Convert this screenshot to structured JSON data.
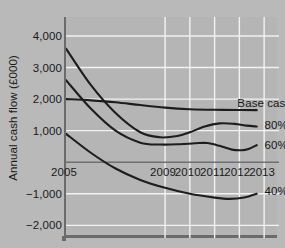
{
  "chart_data": {
    "type": "line",
    "title": "",
    "subtitle": "",
    "xlabel": "",
    "ylabel": "Annual cash flow (£000)",
    "x": [
      2005,
      2009,
      2010,
      2011,
      2012,
      2013
    ],
    "xtick_labels": [
      "2005",
      "2009",
      "2010",
      "2011",
      "2012",
      "2013"
    ],
    "ytick_labels": [
      "4,000",
      "3,000",
      "2,000",
      "1,000",
      "−1,000",
      "−2,000"
    ],
    "ytick_values": [
      4000,
      3000,
      2000,
      1000,
      -1000,
      -2000
    ],
    "xlim": [
      2005,
      2013.6
    ],
    "ylim": [
      -2400,
      4600
    ],
    "grid": true,
    "grid_color": "#f2f2f2",
    "zero_line": true,
    "zero_line_label": "2005",
    "background_color": "#b5b5b5",
    "line_color": "#1d1d1d",
    "legend_position": "inline-right",
    "annotations": [
      {
        "text": "Base case",
        "x": 2012.0,
        "y": 1850
      },
      {
        "text": "80%",
        "x": 2013.1,
        "y": 1150
      },
      {
        "text": "60%",
        "x": 2013.1,
        "y": 500
      },
      {
        "text": "40%",
        "x": 2013.1,
        "y": -950
      }
    ],
    "series": [
      {
        "name": "Base case",
        "label": "Base case",
        "points": [
          {
            "x": 2005.0,
            "y": 2000
          },
          {
            "x": 2006.0,
            "y": 1960
          },
          {
            "x": 2007.0,
            "y": 1900
          },
          {
            "x": 2008.0,
            "y": 1810
          },
          {
            "x": 2009.0,
            "y": 1730
          },
          {
            "x": 2010.0,
            "y": 1680
          },
          {
            "x": 2011.0,
            "y": 1660
          },
          {
            "x": 2012.0,
            "y": 1655
          },
          {
            "x": 2012.7,
            "y": 1650
          }
        ]
      },
      {
        "name": "80%",
        "label": "80%",
        "points": [
          {
            "x": 2005.0,
            "y": 3600
          },
          {
            "x": 2006.0,
            "y": 2450
          },
          {
            "x": 2007.0,
            "y": 1560
          },
          {
            "x": 2008.0,
            "y": 950
          },
          {
            "x": 2008.8,
            "y": 790
          },
          {
            "x": 2009.5,
            "y": 830
          },
          {
            "x": 2010.0,
            "y": 950
          },
          {
            "x": 2010.6,
            "y": 1130
          },
          {
            "x": 2011.2,
            "y": 1230
          },
          {
            "x": 2011.8,
            "y": 1215
          },
          {
            "x": 2012.3,
            "y": 1160
          },
          {
            "x": 2012.7,
            "y": 1130
          }
        ]
      },
      {
        "name": "60%",
        "label": "60%",
        "points": [
          {
            "x": 2005.0,
            "y": 2600
          },
          {
            "x": 2006.0,
            "y": 1700
          },
          {
            "x": 2007.0,
            "y": 1000
          },
          {
            "x": 2008.0,
            "y": 620
          },
          {
            "x": 2008.8,
            "y": 560
          },
          {
            "x": 2009.6,
            "y": 570
          },
          {
            "x": 2010.2,
            "y": 600
          },
          {
            "x": 2010.7,
            "y": 610
          },
          {
            "x": 2011.2,
            "y": 520
          },
          {
            "x": 2011.7,
            "y": 400
          },
          {
            "x": 2012.1,
            "y": 380
          },
          {
            "x": 2012.4,
            "y": 430
          },
          {
            "x": 2012.7,
            "y": 540
          }
        ]
      },
      {
        "name": "40%",
        "label": "40%",
        "points": [
          {
            "x": 2005.0,
            "y": 900
          },
          {
            "x": 2006.0,
            "y": 300
          },
          {
            "x": 2007.0,
            "y": -200
          },
          {
            "x": 2008.0,
            "y": -560
          },
          {
            "x": 2009.0,
            "y": -810
          },
          {
            "x": 2010.0,
            "y": -1000
          },
          {
            "x": 2011.0,
            "y": -1120
          },
          {
            "x": 2011.6,
            "y": -1160
          },
          {
            "x": 2012.2,
            "y": -1120
          },
          {
            "x": 2012.7,
            "y": -1000
          }
        ]
      }
    ]
  }
}
